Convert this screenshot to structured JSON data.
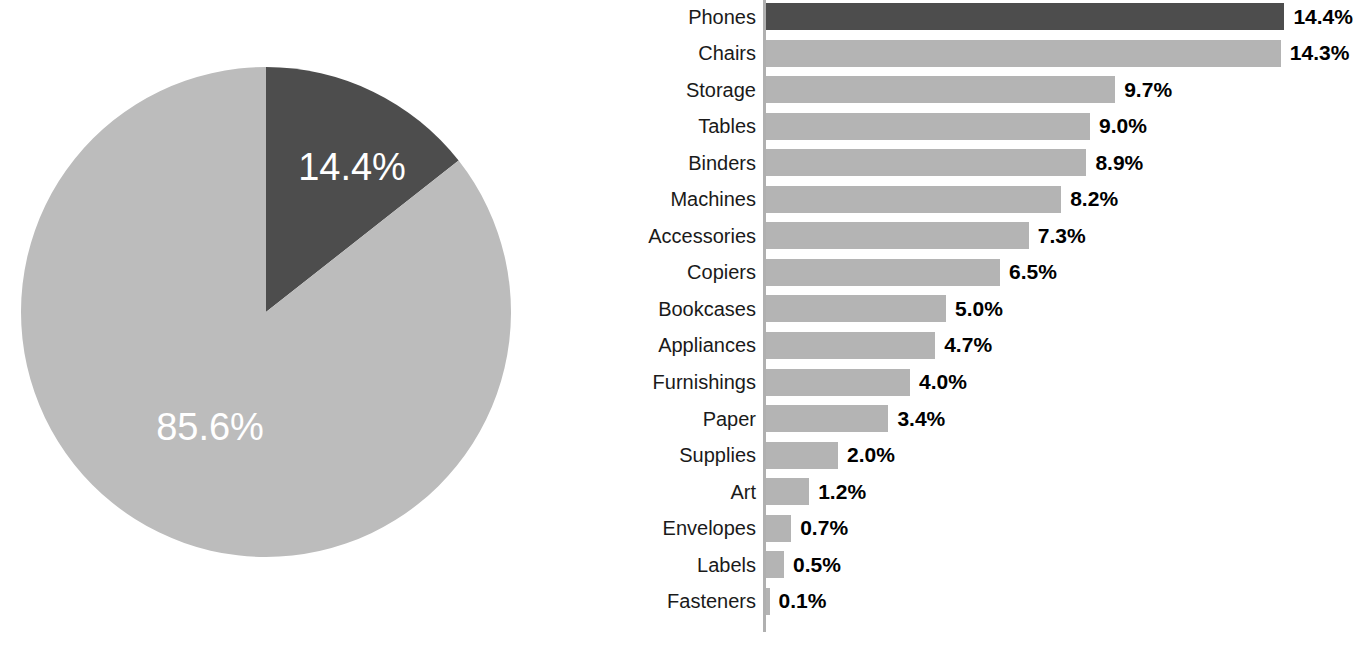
{
  "chart_data": [
    {
      "type": "pie",
      "title": "",
      "name": "phones-share-pie",
      "labels": [
        "Phones",
        "Other"
      ],
      "values": [
        14.4,
        85.6
      ],
      "display_labels": [
        "14.4%",
        "85.6%"
      ],
      "colors": [
        "#4d4d4d",
        "#bcbcbc"
      ],
      "start_angle_deg": 0,
      "direction": "clockwise",
      "legend": "none",
      "grid": false
    },
    {
      "type": "bar",
      "orientation": "horizontal",
      "name": "sub-category-share-bar",
      "title": "",
      "xlabel": "",
      "ylabel": "",
      "xlim": [
        0,
        14.4
      ],
      "grid": false,
      "legend": "none",
      "axis_line": true,
      "categories": [
        "Phones",
        "Chairs",
        "Storage",
        "Tables",
        "Binders",
        "Machines",
        "Accessories",
        "Copiers",
        "Bookcases",
        "Appliances",
        "Furnishings",
        "Paper",
        "Supplies",
        "Art",
        "Envelopes",
        "Labels",
        "Fasteners"
      ],
      "values": [
        14.4,
        14.3,
        9.7,
        9.0,
        8.9,
        8.2,
        7.3,
        6.5,
        5.0,
        4.7,
        4.0,
        3.4,
        2.0,
        1.2,
        0.7,
        0.5,
        0.1
      ],
      "value_labels": [
        "14.4%",
        "14.3%",
        "9.7%",
        "9.0%",
        "8.9%",
        "8.2%",
        "7.3%",
        "6.5%",
        "5.0%",
        "4.7%",
        "4.0%",
        "3.4%",
        "2.0%",
        "1.2%",
        "0.7%",
        "0.5%",
        "0.1%"
      ],
      "highlight_index": 0,
      "bar_color": "#b4b4b4",
      "highlight_color": "#4d4d4d"
    }
  ],
  "colors": {
    "background": "#ffffff",
    "bar_default": "#b4b4b4",
    "bar_highlight": "#4d4d4d",
    "pie_slice_highlight": "#4d4d4d",
    "pie_slice_other": "#bcbcbc",
    "axis_line": "#b0b0b0",
    "label_text": "#1a1a1a",
    "value_text": "#000000",
    "pie_label_text": "#ffffff"
  },
  "pie": {
    "slices": [
      {
        "label": "14.4%",
        "value": 14.4,
        "color": "#4d4d4d",
        "label_x": 352,
        "label_y": 170
      },
      {
        "label": "85.6%",
        "value": 85.6,
        "color": "#bcbcbc",
        "label_x": 210,
        "label_y": 430
      }
    ]
  }
}
